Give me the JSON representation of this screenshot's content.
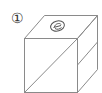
{
  "figure": {
    "label": "①",
    "top_face_symbol": "circled-e-symbol",
    "front_face": "diagonal from bottom-left to top-right",
    "right_face": "diagonal from front edge middle to back edge",
    "stroke_color": "#8a8a8a",
    "background": "#ffffff"
  }
}
